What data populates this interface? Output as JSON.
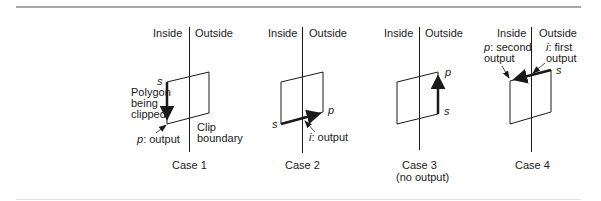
{
  "diagram": {
    "type": "polygon-clipping-cases",
    "labels": {
      "inside": "Inside",
      "outside": "Outside",
      "s": "s",
      "p": "p"
    },
    "cases": [
      {
        "title": "Case 1",
        "subtitle": "",
        "annotations": {
          "polygon_line1": "Polygon",
          "polygon_line2": "being",
          "polygon_line3": "clipped",
          "p_label": "p",
          "p_text": ": output",
          "clip_line1": "Clip",
          "clip_line2": "boundary"
        }
      },
      {
        "title": "Case 2",
        "subtitle": "",
        "annotations": {
          "i_label": "i",
          "i_text": ": output"
        }
      },
      {
        "title": "Case 3",
        "subtitle": "(no output)",
        "annotations": {}
      },
      {
        "title": "Case 4",
        "subtitle": "",
        "annotations": {
          "p_label": "p",
          "p_text": ": second",
          "p_text2": "output",
          "i_label": "i",
          "i_text": ": first",
          "i_text2": "output"
        }
      }
    ],
    "colors": {
      "stroke": "#1a1a1a",
      "rule": "#a8a8a8"
    }
  }
}
